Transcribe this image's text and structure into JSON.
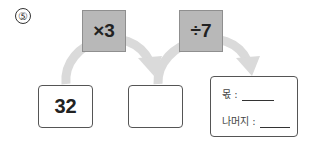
{
  "problem": {
    "number_label": "⑤",
    "operations": [
      {
        "label": "×3"
      },
      {
        "label": "÷7"
      }
    ],
    "start_value": "32",
    "middle_value": "",
    "result": {
      "quotient_label": "몫 :",
      "quotient_value": "",
      "remainder_label": "나머지 :",
      "remainder_value": ""
    }
  },
  "colors": {
    "operation_box": "#b8b8b8",
    "arrow": "#d9d9d9",
    "border": "#555555"
  }
}
